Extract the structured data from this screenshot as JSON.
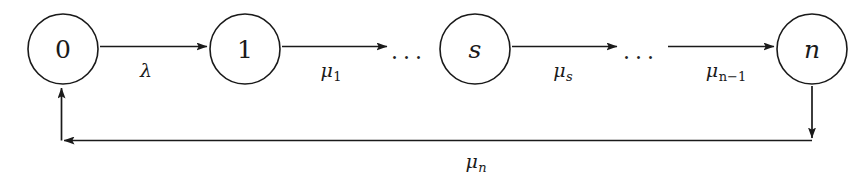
{
  "figure": {
    "kind": "state-transition-diagram",
    "background_color": "#ffffff",
    "stroke_color": "#1a1a1a"
  },
  "nodes": [
    {
      "id": "state-0",
      "label": "0",
      "style": "numeric",
      "cx": 63,
      "cy": 49,
      "r": 35
    },
    {
      "id": "state-1",
      "label": "1",
      "style": "numeric",
      "cx": 245,
      "cy": 49,
      "r": 35
    },
    {
      "id": "state-s",
      "label": "s",
      "style": "italic",
      "cx": 475,
      "cy": 49,
      "r": 35
    },
    {
      "id": "state-n",
      "label": "n",
      "style": "italic",
      "cx": 812,
      "cy": 49,
      "r": 35
    }
  ],
  "ellipses": [
    {
      "id": "ellipsis-1",
      "label": "...",
      "x": 409,
      "y": 52
    },
    {
      "id": "ellipsis-2",
      "label": "...",
      "x": 641,
      "y": 52
    }
  ],
  "edges": [
    {
      "id": "edge-0-to-1",
      "from": "state-0",
      "to": "state-1",
      "label": "λ",
      "subscript": "",
      "label_x": 146,
      "label_y": 70
    },
    {
      "id": "edge-1-to-ellipsis",
      "from": "state-1",
      "to": "ellipsis-1",
      "label": "μ",
      "subscript": "1",
      "subscript_upright": true,
      "label_x": 331,
      "label_y": 72
    },
    {
      "id": "edge-s-to-ellipsis",
      "from": "state-s",
      "to": "ellipsis-2",
      "label": "μ",
      "subscript": "s",
      "subscript_upright": false,
      "label_x": 563,
      "label_y": 72
    },
    {
      "id": "edge-ellipsis-to-n",
      "from": "ellipsis-2",
      "to": "state-n",
      "label": "μ",
      "subscript": "n−1",
      "subscript_upright": true,
      "label_x": 726,
      "label_y": 72
    },
    {
      "id": "edge-n-to-0-feedback",
      "from": "state-n",
      "to": "state-0",
      "label": "μ",
      "subscript": "n",
      "subscript_upright": false,
      "label_x": 476,
      "label_y": 163
    }
  ]
}
